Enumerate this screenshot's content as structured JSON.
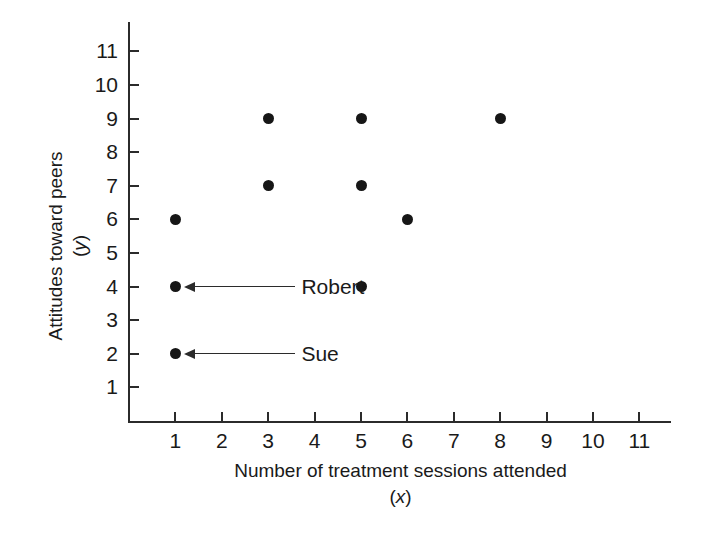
{
  "chart_data": {
    "type": "scatter",
    "title": "",
    "xlabel": "Number of treatment sessions attended",
    "xlabel_symbol": "(x)",
    "ylabel": "Attitudes toward peers",
    "ylabel_symbol": "(y)",
    "xlim": [
      0,
      11.8
    ],
    "ylim": [
      0,
      11.8
    ],
    "xticks": [
      1,
      2,
      3,
      4,
      5,
      6,
      7,
      8,
      9,
      10,
      11
    ],
    "yticks": [
      1,
      2,
      3,
      4,
      5,
      6,
      7,
      8,
      9,
      10,
      11
    ],
    "xtick_labels": [
      "1",
      "2",
      "3",
      "4",
      "5",
      "6",
      "7",
      "8",
      "9",
      "10",
      "11"
    ],
    "ytick_labels": [
      "1",
      "2",
      "3",
      "4",
      "5",
      "6",
      "7",
      "8",
      "9",
      "10",
      "11"
    ],
    "grid": false,
    "legend": false,
    "marker": "filled-circle",
    "marker_color": "#161616",
    "points": [
      {
        "x": 1,
        "y": 6,
        "label": ""
      },
      {
        "x": 1,
        "y": 4,
        "label": "Robert"
      },
      {
        "x": 1,
        "y": 2,
        "label": "Sue"
      },
      {
        "x": 3,
        "y": 9,
        "label": ""
      },
      {
        "x": 3,
        "y": 7,
        "label": ""
      },
      {
        "x": 5,
        "y": 9,
        "label": ""
      },
      {
        "x": 5,
        "y": 7,
        "label": ""
      },
      {
        "x": 5,
        "y": 4,
        "label": ""
      },
      {
        "x": 6,
        "y": 6,
        "label": ""
      },
      {
        "x": 8,
        "y": 9,
        "label": ""
      }
    ],
    "annotations": [
      {
        "text": "Robert",
        "point_x": 1,
        "point_y": 4
      },
      {
        "text": "Sue",
        "point_x": 1,
        "point_y": 2
      }
    ],
    "colors": {
      "axis": "#2b2b2b",
      "marker": "#161616",
      "text": "#1a1a1a",
      "background": "#ffffff"
    }
  }
}
